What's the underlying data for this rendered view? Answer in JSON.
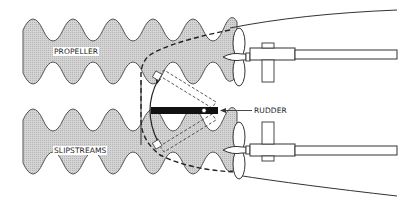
{
  "diagram": {
    "labels": {
      "propeller": "PROPELLER",
      "slipstreams": "SLIPSTREAMS",
      "rudder": "RUDDER"
    },
    "colors": {
      "stroke": "#333333",
      "slipstream_fill": "#c8c8c8",
      "rudder": "#111111",
      "background": "#ffffff"
    }
  }
}
